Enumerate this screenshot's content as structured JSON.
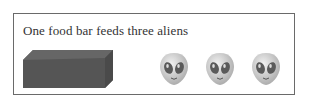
{
  "caption": "One food bar feeds three aliens",
  "food_bar": {
    "icon": "food-bar-block",
    "color": "#555555"
  },
  "aliens": [
    {
      "icon": "alien-face-emoji"
    },
    {
      "icon": "alien-face-emoji"
    },
    {
      "icon": "alien-face-emoji"
    }
  ],
  "colors": {
    "border": "#6a6a6a",
    "text": "#333333",
    "bar": "#555555",
    "alien": "#cfcfcf"
  }
}
